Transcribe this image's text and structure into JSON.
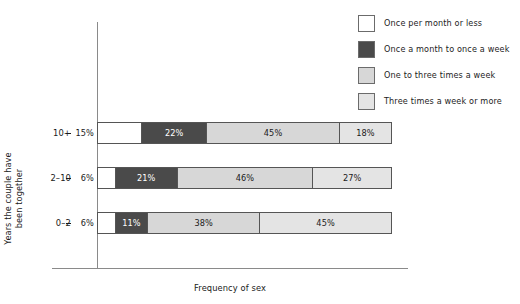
{
  "chart_data": {
    "type": "bar",
    "subtype": "horizontal-100-percent-stacked",
    "title": "",
    "xlabel": "Frequency of sex",
    "ylabel": "Years the couple have been together",
    "ylabel_lines": [
      "Years the couple have",
      "been together"
    ],
    "categories": [
      "10+",
      "2–10",
      "0–2"
    ],
    "xlim": [
      0,
      100
    ],
    "grid": false,
    "legend_position": "top-right",
    "series": [
      {
        "name": "Once per month or less",
        "color": "#ffffff",
        "values": [
          15,
          6,
          6
        ],
        "labels": [
          "15%",
          "6%",
          "6%"
        ]
      },
      {
        "name": "Once a month to once a week",
        "color": "#4a4a4a",
        "values": [
          22,
          21,
          11
        ],
        "labels": [
          "22%",
          "21%",
          "11%"
        ]
      },
      {
        "name": "One to three times a week",
        "color": "#d7d7d7",
        "values": [
          45,
          46,
          38
        ],
        "labels": [
          "45%",
          "46%",
          "38%"
        ]
      },
      {
        "name": "Three times a week or more",
        "color": "#e4e4e4",
        "values": [
          18,
          27,
          45
        ],
        "labels": [
          "18%",
          "27%",
          "45%"
        ]
      }
    ]
  },
  "legend": {
    "items": [
      {
        "label": "Once per month or less",
        "color": "#ffffff"
      },
      {
        "label": "Once a month to once a week",
        "color": "#4a4a4a"
      },
      {
        "label": "One to three times a week",
        "color": "#d7d7d7"
      },
      {
        "label": "Three times a week or more",
        "color": "#e4e4e4"
      }
    ]
  },
  "axes": {
    "x_title": "Frequency of sex",
    "y_title_line1": "Years the couple have",
    "y_title_line2": "been together",
    "y_ticks": [
      "10+",
      "2–10",
      "0–2"
    ]
  },
  "rows": [
    {
      "category": "10+",
      "cells": [
        {
          "label": "15%",
          "value": 15
        },
        {
          "label": "22%",
          "value": 22
        },
        {
          "label": "45%",
          "value": 45
        },
        {
          "label": "18%",
          "value": 18
        }
      ]
    },
    {
      "category": "2–10",
      "cells": [
        {
          "label": "6%",
          "value": 6
        },
        {
          "label": "21%",
          "value": 21
        },
        {
          "label": "46%",
          "value": 46
        },
        {
          "label": "27%",
          "value": 27
        }
      ]
    },
    {
      "category": "0–2",
      "cells": [
        {
          "label": "6%",
          "value": 6
        },
        {
          "label": "11%",
          "value": 11
        },
        {
          "label": "38%",
          "value": 38
        },
        {
          "label": "45%",
          "value": 45
        }
      ]
    }
  ]
}
